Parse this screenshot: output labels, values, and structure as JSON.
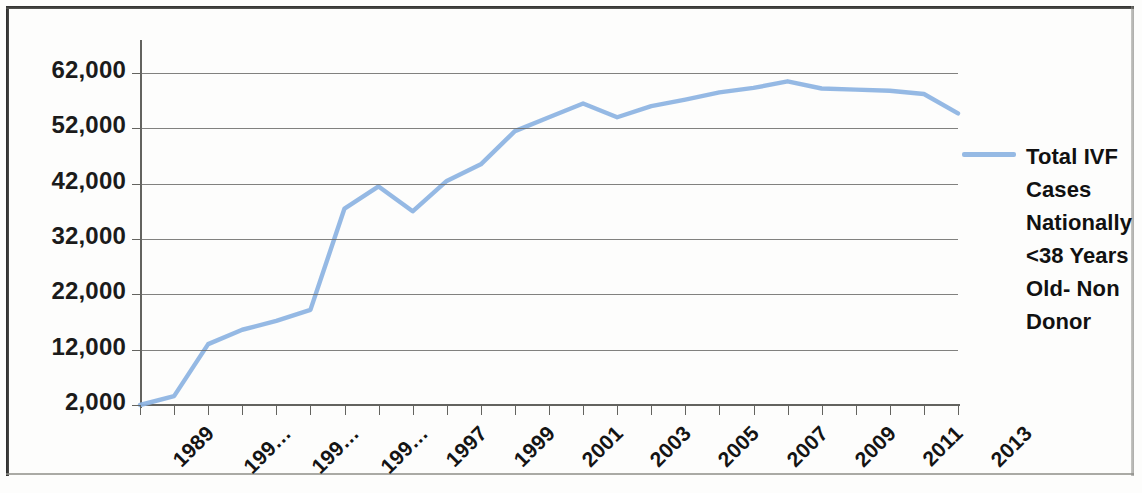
{
  "chart_data": {
    "type": "line",
    "title": "",
    "subtitle": "",
    "xlabel": "",
    "ylabel": "",
    "grid": "horizontal",
    "legend_position": "right",
    "line_color": "#8DB4E2",
    "gridline_color": "#6B6B68",
    "axis_color": "#63635F",
    "x": [
      1989,
      1990,
      1991,
      1992,
      1993,
      1994,
      1995,
      1996,
      1997,
      1998,
      1999,
      2000,
      2001,
      2002,
      2003,
      2004,
      2005,
      2006,
      2007,
      2008,
      2009,
      2010,
      2011,
      2012,
      2013
    ],
    "xlim": [
      1989,
      2013
    ],
    "ylim": [
      2000,
      62000
    ],
    "ytick_values": [
      2000,
      12000,
      22000,
      32000,
      42000,
      52000,
      62000
    ],
    "ytick_labels": [
      "2,000",
      "12,000",
      "22,000",
      "32,000",
      "42,000",
      "52,000",
      "62,000"
    ],
    "xtick_labels": [
      {
        "year": 1989,
        "label": "1989"
      },
      {
        "year": 1991,
        "label": "199…"
      },
      {
        "year": 1993,
        "label": "199…"
      },
      {
        "year": 1995,
        "label": "199…"
      },
      {
        "year": 1997,
        "label": "1997"
      },
      {
        "year": 1999,
        "label": "1999"
      },
      {
        "year": 2001,
        "label": "2001"
      },
      {
        "year": 2003,
        "label": "2003"
      },
      {
        "year": 2005,
        "label": "2005"
      },
      {
        "year": 2007,
        "label": "2007"
      },
      {
        "year": 2009,
        "label": "2009"
      },
      {
        "year": 2011,
        "label": "2011"
      },
      {
        "year": 2013,
        "label": "2013"
      }
    ],
    "series": [
      {
        "name": "Total IVF Cases Nationally <38 Years Old- Non Donor",
        "color": "#8DB4E2",
        "values": [
          2000,
          3600,
          13000,
          15600,
          17200,
          19200,
          37500,
          41500,
          37000,
          42500,
          45500,
          51500,
          54000,
          56500,
          54000,
          56000,
          57200,
          58500,
          59300,
          60500,
          59200,
          59000,
          58800,
          58200,
          54700
        ]
      }
    ],
    "legend": [
      {
        "swatch_color": "#8DB4E2",
        "lines": [
          "Total IVF",
          "Cases",
          "Nationally",
          "<38 Years",
          "Old- Non",
          "Donor"
        ]
      }
    ]
  }
}
